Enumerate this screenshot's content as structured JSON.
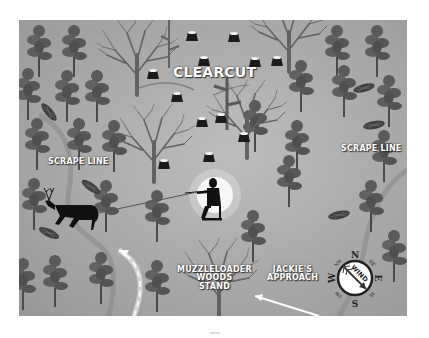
{
  "map": {
    "labels": {
      "clearcut": "CLEARCUT",
      "scrape_line_left": "SCRAPE LINE",
      "scrape_line_right": "SCRAPE LINE",
      "stand": [
        "MUZZLELOADER",
        "WOODS",
        "STAND"
      ],
      "approach": [
        "JACKIE'S",
        "APPROACH"
      ]
    },
    "compass": {
      "center_text": "WIND",
      "directions": {
        "n": "N",
        "ne": "NE",
        "e": "E",
        "se": "SE",
        "s": "S",
        "sw": "SW",
        "w": "W",
        "nw": "NW"
      },
      "wind_direction": "NW to SE"
    },
    "colors": {
      "background": "#a9a9a9",
      "pine": "#5c5c5c",
      "bare_tree": "#626262",
      "silhouette": "#111111",
      "label_text": "#ffffff"
    }
  }
}
